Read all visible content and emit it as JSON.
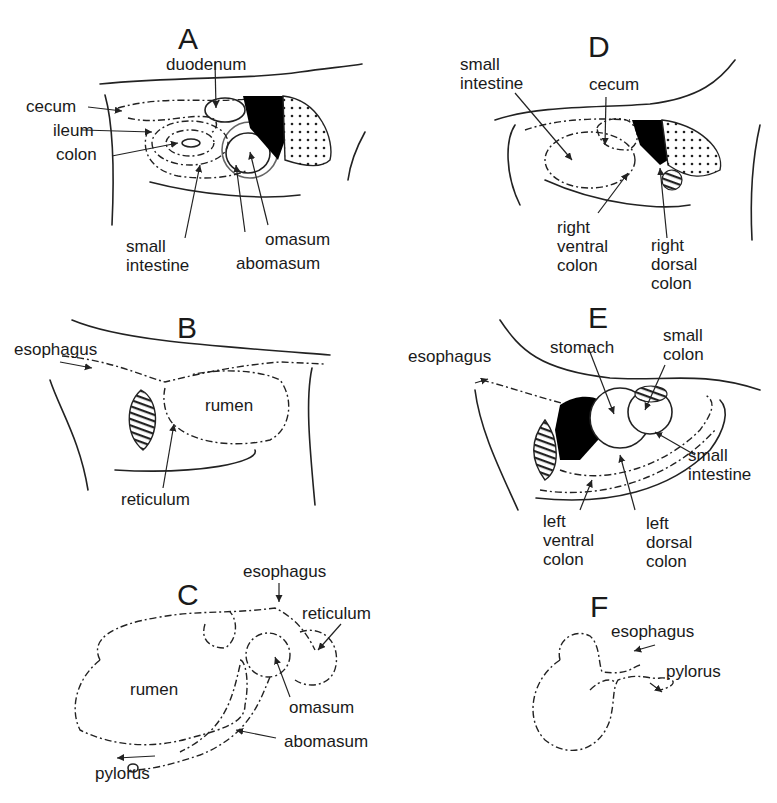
{
  "figure": {
    "panels": [
      {
        "id": "A",
        "letter": "A",
        "labels": [
          "duodenum",
          "cecum",
          "ileum",
          "colon",
          "small\nintestine",
          "omasum",
          "abomasum"
        ]
      },
      {
        "id": "B",
        "letter": "B",
        "labels": [
          "esophagus",
          "rumen",
          "reticulum"
        ]
      },
      {
        "id": "C",
        "letter": "C",
        "labels": [
          "esophagus",
          "reticulum",
          "rumen",
          "omasum",
          "abomasum",
          "pylorus"
        ]
      },
      {
        "id": "D",
        "letter": "D",
        "labels": [
          "small\nintestine",
          "cecum",
          "right\nventral\ncolon",
          "right\ndorsal\ncolon"
        ]
      },
      {
        "id": "E",
        "letter": "E",
        "labels": [
          "esophagus",
          "stomach",
          "small\ncolon",
          "small\nintestine",
          "left\nventral\ncolon",
          "left\ndorsal\ncolon"
        ]
      },
      {
        "id": "F",
        "letter": "F",
        "labels": [
          "esophagus",
          "pylorus"
        ]
      }
    ]
  },
  "colors": {
    "ink": "#1a1a1a",
    "background": "#ffffff",
    "solid_fill": "#000000"
  }
}
